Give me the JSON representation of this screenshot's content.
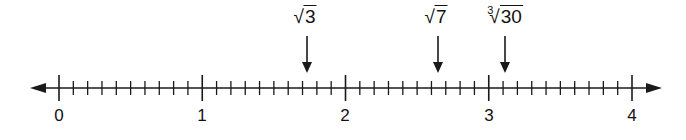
{
  "number_line": {
    "min": 0,
    "max": 4,
    "subdivisions_per_unit": 10,
    "major_labels": [
      "0",
      "1",
      "2",
      "3",
      "4"
    ],
    "arrows_both_ends": true
  },
  "markers": [
    {
      "index": "",
      "radicand": "3",
      "approx_value": 1.73
    },
    {
      "index": "",
      "radicand": "7",
      "approx_value": 2.65
    },
    {
      "index": "3",
      "radicand": "30",
      "approx_value": 3.11
    }
  ],
  "colors": {
    "line": "#1a1a1a",
    "text": "#111111"
  }
}
